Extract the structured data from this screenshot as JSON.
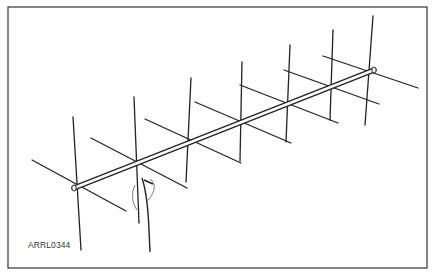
{
  "figure": {
    "caption_id": "ARRL0344",
    "stroke_color": "#222222",
    "background": "#ffffff"
  },
  "diagram": {
    "frame": {
      "x1": 8,
      "y1": 7,
      "x2": 427,
      "y2": 268
    },
    "boom": {
      "x1": 74,
      "y1": 188,
      "x2": 374,
      "y2": 70
    },
    "vertical_elements": [
      {
        "x1": 73,
        "y1": 117,
        "x2": 81,
        "y2": 250
      },
      {
        "x1": 134,
        "y1": 97,
        "x2": 139,
        "y2": 223
      },
      {
        "x1": 191,
        "y1": 78,
        "x2": 186,
        "y2": 182
      },
      {
        "x1": 242,
        "y1": 62,
        "x2": 240,
        "y2": 161
      },
      {
        "x1": 290,
        "y1": 45,
        "x2": 286,
        "y2": 142
      },
      {
        "x1": 333,
        "y1": 30,
        "x2": 330,
        "y2": 120
      },
      {
        "x1": 373,
        "y1": 16,
        "x2": 365,
        "y2": 125
      }
    ],
    "horizontal_elements": [
      {
        "x1": 32,
        "y1": 160,
        "x2": 126,
        "y2": 211
      },
      {
        "x1": 91,
        "y1": 138,
        "x2": 187,
        "y2": 188
      },
      {
        "x1": 145,
        "y1": 119,
        "x2": 241,
        "y2": 163
      },
      {
        "x1": 195,
        "y1": 102,
        "x2": 291,
        "y2": 143
      },
      {
        "x1": 240,
        "y1": 85,
        "x2": 338,
        "y2": 123
      },
      {
        "x1": 284,
        "y1": 70,
        "x2": 379,
        "y2": 104
      },
      {
        "x1": 323,
        "y1": 56,
        "x2": 418,
        "y2": 88
      }
    ]
  }
}
